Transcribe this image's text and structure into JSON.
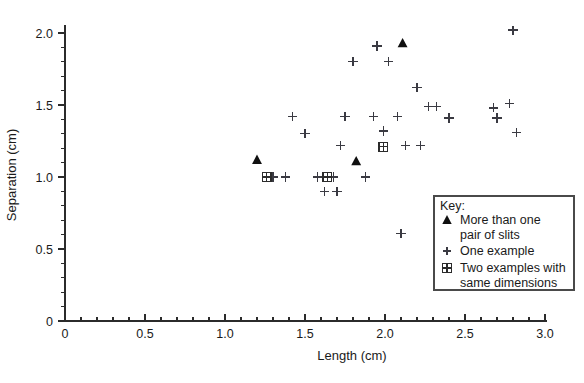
{
  "chart_data": {
    "type": "scatter",
    "title": "",
    "xlabel": "Length (cm)",
    "ylabel": "Separation (cm)",
    "xlim": [
      0,
      3.0
    ],
    "ylim": [
      0,
      2.0
    ],
    "grid": false,
    "x_major_ticks": [
      0,
      0.5,
      1.0,
      1.5,
      2.0,
      2.5,
      3.0
    ],
    "x_major_labels": [
      "0",
      "0.5",
      "1.0",
      "1.5",
      "2.0",
      "2.5",
      "3.0"
    ],
    "x_minor_step": 0.1,
    "y_major_ticks": [
      0,
      0.5,
      1.0,
      1.5,
      2.0
    ],
    "y_major_labels": [
      "0",
      "0.5",
      "1.0",
      "1.5",
      "2.0"
    ],
    "y_minor_step": 0.1,
    "legend_position": "lower-right",
    "legend_title": "Key:",
    "series": [
      {
        "name": "More than one pair of slits",
        "marker": "triangle",
        "points": [
          [
            1.2,
            1.12
          ],
          [
            1.82,
            1.11
          ],
          [
            2.11,
            1.93
          ]
        ]
      },
      {
        "name": "One example",
        "marker": "plus",
        "points": [
          [
            1.3,
            1.0
          ],
          [
            1.38,
            1.0
          ],
          [
            1.42,
            1.42
          ],
          [
            1.5,
            1.3
          ],
          [
            1.58,
            1.0
          ],
          [
            1.62,
            0.9
          ],
          [
            1.68,
            1.0
          ],
          [
            1.7,
            0.9
          ],
          [
            1.72,
            1.22
          ],
          [
            1.75,
            1.42
          ],
          [
            1.8,
            1.8
          ],
          [
            1.88,
            1.0
          ],
          [
            1.93,
            1.42
          ],
          [
            1.95,
            1.91
          ],
          [
            1.99,
            1.32
          ],
          [
            2.02,
            1.8
          ],
          [
            2.08,
            1.42
          ],
          [
            2.1,
            0.61
          ],
          [
            2.13,
            1.22
          ],
          [
            2.2,
            1.62
          ],
          [
            2.22,
            1.22
          ],
          [
            2.27,
            1.49
          ],
          [
            2.32,
            1.49
          ],
          [
            2.4,
            1.41
          ],
          [
            2.68,
            1.48
          ],
          [
            2.7,
            1.41
          ],
          [
            2.78,
            1.51
          ],
          [
            2.8,
            2.02
          ],
          [
            2.82,
            1.31
          ]
        ]
      },
      {
        "name": "Two examples with same dimensions",
        "marker": "square-cross",
        "points": [
          [
            1.26,
            1.0
          ],
          [
            1.64,
            1.0
          ],
          [
            1.99,
            1.21
          ]
        ]
      }
    ]
  },
  "legend": {
    "title": "Key:",
    "items": [
      {
        "marker": "triangle",
        "line1": "More than one",
        "line2": "pair of slits"
      },
      {
        "marker": "plus",
        "line1": "One example",
        "line2": ""
      },
      {
        "marker": "square-cross",
        "line1": "Two examples with",
        "line2": "same dimensions"
      }
    ]
  },
  "colors": {
    "background": "#ffffff",
    "axis": "#2b2b2b",
    "marker": "#3a3a42",
    "marker_solid": "#101010",
    "text": "#1a1a1a"
  }
}
